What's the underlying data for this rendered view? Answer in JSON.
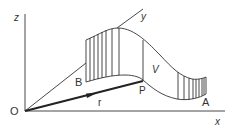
{
  "diagram": {
    "axes": {
      "x_label": "x",
      "y_label": "y",
      "z_label": "z",
      "origin_label": "O"
    },
    "points": {
      "A": "A",
      "B": "B",
      "P": "P"
    },
    "vector_label": "r",
    "surface_label": "V",
    "colors": {
      "stroke": "#333333",
      "background": "#ffffff"
    }
  }
}
